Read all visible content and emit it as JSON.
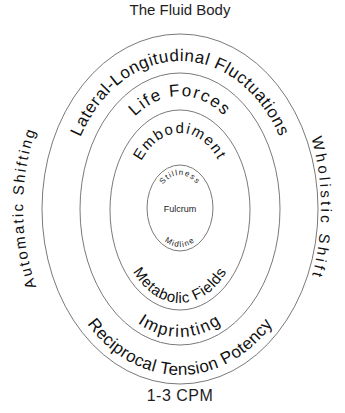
{
  "title": "The Fluid Body",
  "footer": "1-3 CPM",
  "rings": {
    "outer": {
      "top_label": "Lateral-Longitudinal Fluctuations",
      "bottom_label": "Reciprocal Tension Potency",
      "left_outside_label": "Automatic Shifting",
      "right_outside_label": "Wholistic Shift"
    },
    "second": {
      "top_label": "Life Forces",
      "bottom_label": "Imprinting"
    },
    "third": {
      "top_label": "Embodiment",
      "bottom_label": "Metabolic Fields"
    },
    "inner": {
      "top_label": "Stillness",
      "center_label": "Fulcrum",
      "bottom_label": "Midline"
    }
  },
  "colors": {
    "stroke": "#6a6a6a",
    "text": "#111111",
    "background": "#ffffff"
  }
}
